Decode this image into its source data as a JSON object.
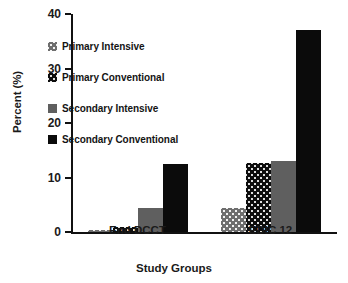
{
  "chart_data": {
    "type": "bar",
    "title": "",
    "xlabel": "Study Groups",
    "ylabel": "Percent (%)",
    "categories": [
      "End DCCT",
      "EDIC 12"
    ],
    "ylim": [
      0,
      40
    ],
    "yticks": [
      "0",
      "10",
      "20",
      "30",
      "40"
    ],
    "grid": false,
    "legend_position": "upper-left-inside",
    "series": [
      {
        "name": "Primary Intensive",
        "values": [
          0.4,
          4.4
        ],
        "fill": "dot-gray",
        "color": "#6e6e6e"
      },
      {
        "name": "Primary Conventional",
        "values": [
          1.0,
          12.7
        ],
        "fill": "dot-black",
        "color": "#0d0d0d"
      },
      {
        "name": "Secondary Intensive",
        "values": [
          4.4,
          13.0
        ],
        "fill": "gray",
        "color": "#5f5f5f"
      },
      {
        "name": "Secondary Conventional",
        "values": [
          12.5,
          37.0
        ],
        "fill": "black",
        "color": "#0b0b0b"
      }
    ]
  }
}
